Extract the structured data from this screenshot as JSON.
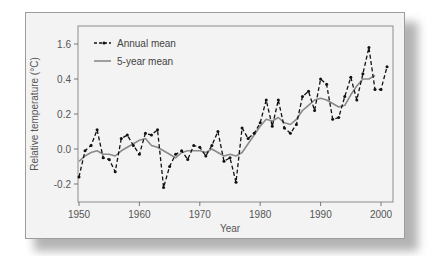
{
  "chart_data": {
    "type": "line",
    "title": "",
    "xlabel": "Year",
    "ylabel": "Relative temperature (°C)",
    "xlim": [
      1950,
      2002
    ],
    "ylim": [
      -0.3,
      0.65
    ],
    "x_ticks": [
      1950,
      1960,
      1970,
      1980,
      1990,
      2000
    ],
    "y_ticks": [
      {
        "value": 0.6,
        "label": "1.6"
      },
      {
        "value": 0.4,
        "label": "0.4"
      },
      {
        "value": 0.2,
        "label": "0.2"
      },
      {
        "value": 0.0,
        "label": "0.0"
      },
      {
        "value": -0.2,
        "label": "-0.2"
      }
    ],
    "grid": false,
    "legend_position": "upper-left",
    "series": [
      {
        "name": "Annual mean",
        "style": "dashed-with-markers",
        "color": "#111111",
        "x": [
          1950,
          1951,
          1952,
          1953,
          1954,
          1955,
          1956,
          1957,
          1958,
          1959,
          1960,
          1961,
          1962,
          1963,
          1964,
          1965,
          1966,
          1967,
          1968,
          1969,
          1970,
          1971,
          1972,
          1973,
          1974,
          1975,
          1976,
          1977,
          1978,
          1979,
          1980,
          1981,
          1982,
          1983,
          1984,
          1985,
          1986,
          1987,
          1988,
          1989,
          1990,
          1991,
          1992,
          1993,
          1994,
          1995,
          1996,
          1997,
          1998,
          1999,
          2000,
          2001
        ],
        "values": [
          -0.16,
          -0.01,
          0.02,
          0.11,
          -0.05,
          -0.06,
          -0.13,
          0.06,
          0.08,
          0.02,
          -0.03,
          0.09,
          0.08,
          0.11,
          -0.22,
          -0.1,
          -0.03,
          -0.01,
          -0.06,
          0.02,
          0.01,
          -0.04,
          0.02,
          0.1,
          -0.07,
          -0.05,
          -0.19,
          0.12,
          0.06,
          0.09,
          0.15,
          0.28,
          0.13,
          0.28,
          0.12,
          0.09,
          0.14,
          0.3,
          0.33,
          0.22,
          0.4,
          0.37,
          0.17,
          0.18,
          0.3,
          0.41,
          0.28,
          0.43,
          0.58,
          0.34,
          0.34,
          0.47
        ]
      },
      {
        "name": "5-year mean",
        "style": "solid",
        "color": "#8a8a8a",
        "x": [
          1950,
          1951,
          1952,
          1953,
          1954,
          1955,
          1956,
          1957,
          1958,
          1959,
          1960,
          1961,
          1962,
          1963,
          1964,
          1965,
          1966,
          1967,
          1968,
          1969,
          1970,
          1971,
          1972,
          1973,
          1974,
          1975,
          1976,
          1977,
          1978,
          1979,
          1980,
          1981,
          1982,
          1983,
          1984,
          1985,
          1986,
          1987,
          1988,
          1989,
          1990,
          1991,
          1992,
          1993,
          1994,
          1995,
          1996,
          1997,
          1998,
          1999
        ],
        "values": [
          -0.07,
          -0.04,
          -0.02,
          -0.01,
          -0.03,
          -0.03,
          -0.04,
          -0.01,
          0.01,
          0.03,
          0.05,
          0.06,
          0.02,
          0.01,
          -0.01,
          -0.03,
          -0.05,
          -0.02,
          -0.01,
          -0.01,
          -0.01,
          -0.02,
          0.0,
          -0.02,
          -0.04,
          -0.03,
          -0.04,
          -0.02,
          0.03,
          0.08,
          0.13,
          0.17,
          0.16,
          0.18,
          0.15,
          0.14,
          0.17,
          0.22,
          0.25,
          0.28,
          0.29,
          0.28,
          0.26,
          0.24,
          0.25,
          0.31,
          0.36,
          0.4,
          0.4,
          0.42
        ]
      }
    ]
  },
  "legend": {
    "annual_label": "Annual mean",
    "five_year_label": "5-year mean"
  },
  "axes": {
    "x_title": "Year",
    "y_title": "Relative temperature (°C)"
  }
}
